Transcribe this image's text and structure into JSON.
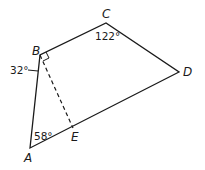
{
  "diagram": {
    "type": "geometry-quadrilateral",
    "vertices": {
      "A": {
        "label": "A",
        "x": 30,
        "y": 148
      },
      "B": {
        "label": "B",
        "x": 40,
        "y": 55
      },
      "C": {
        "label": "C",
        "x": 106,
        "y": 23
      },
      "D": {
        "label": "D",
        "x": 179,
        "y": 72
      },
      "E": {
        "label": "E",
        "x": 73,
        "y": 128
      }
    },
    "angles": {
      "C": "122°",
      "B_outer": "32°",
      "A": "58°"
    },
    "segments": [
      {
        "from": "A",
        "to": "B",
        "style": "solid"
      },
      {
        "from": "B",
        "to": "C",
        "style": "solid"
      },
      {
        "from": "C",
        "to": "D",
        "style": "solid"
      },
      {
        "from": "D",
        "to": "A",
        "style": "solid"
      },
      {
        "from": "B",
        "to": "E",
        "style": "dashed"
      }
    ],
    "right_angle_marker": "B"
  }
}
